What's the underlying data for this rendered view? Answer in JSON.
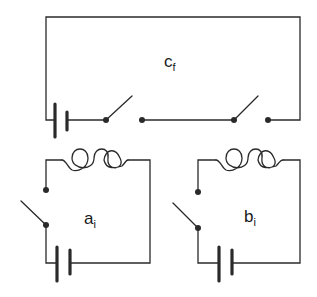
{
  "diagram": {
    "type": "circuit",
    "colors": {
      "wire": "#2a2a2a",
      "background": "#ffffff"
    },
    "circuits": [
      {
        "id": "c",
        "label_main": "c",
        "label_sub": "f",
        "components": [
          "battery",
          "switch (open)",
          "switch (open)"
        ],
        "description": "Series loop with one battery and two open switches"
      },
      {
        "id": "a",
        "label_main": "a",
        "label_sub": "i",
        "components": [
          "battery",
          "switch (open)",
          "inductor coil"
        ],
        "description": "Loop with battery, open switch and coil"
      },
      {
        "id": "b",
        "label_main": "b",
        "label_sub": "i",
        "components": [
          "battery",
          "switch (open)",
          "inductor coil"
        ],
        "description": "Loop with battery, open switch and coil"
      }
    ]
  }
}
